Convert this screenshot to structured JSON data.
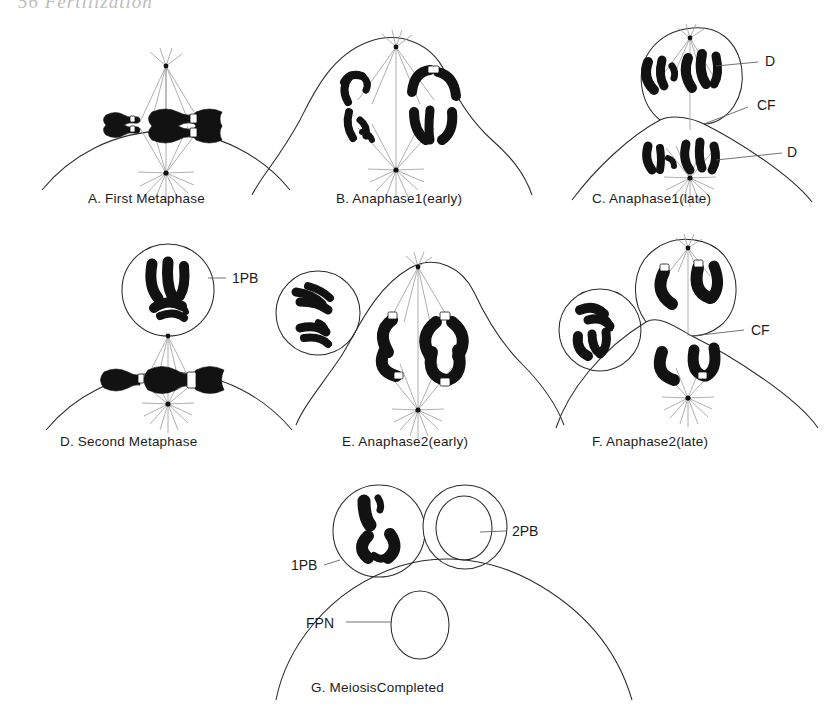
{
  "page": {
    "header_text": "56   Fertilization",
    "width": 831,
    "height": 712,
    "background": "#ffffff",
    "ink_color": "#1c1c1c",
    "chromosome_color": "#121212",
    "spindle_color": "#9a9a9a"
  },
  "figure": {
    "panels": [
      {
        "id": "A",
        "caption": "A. First Metaphase",
        "caption_x": 88,
        "caption_y": 203,
        "labels": []
      },
      {
        "id": "B",
        "caption": "B. Anaphase1(early)",
        "caption_x": 336,
        "caption_y": 203,
        "labels": []
      },
      {
        "id": "C",
        "caption": "C. Anaphase1(late)",
        "caption_x": 592,
        "caption_y": 203,
        "labels": [
          {
            "text": "D",
            "x": 765,
            "y": 66
          },
          {
            "text": "CF",
            "x": 757,
            "y": 110
          },
          {
            "text": "D",
            "x": 787,
            "y": 157
          }
        ]
      },
      {
        "id": "D",
        "caption": "D. Second Metaphase",
        "caption_x": 60,
        "caption_y": 446,
        "labels": [
          {
            "text": "1PB",
            "x": 232,
            "y": 281
          }
        ]
      },
      {
        "id": "E",
        "caption": "E. Anaphase2(early)",
        "caption_x": 342,
        "caption_y": 446,
        "labels": []
      },
      {
        "id": "F",
        "caption": "F. Anaphase2(late)",
        "caption_x": 592,
        "caption_y": 446,
        "labels": [
          {
            "text": "CF",
            "x": 751,
            "y": 332
          }
        ]
      },
      {
        "id": "G",
        "caption": "G. MeiosisCompleted",
        "caption_x": 311,
        "caption_y": 692,
        "labels": [
          {
            "text": "1PB",
            "x": 291,
            "y": 565
          },
          {
            "text": "2PB",
            "x": 486,
            "y": 536
          },
          {
            "text": "FPN",
            "x": 306,
            "y": 623
          }
        ]
      }
    ],
    "legend_abbreviations": [
      {
        "key": "D",
        "meaning": "Dyad"
      },
      {
        "key": "CF",
        "meaning": "Cleavage Furrow"
      },
      {
        "key": "1PB",
        "meaning": "First Polar Body"
      },
      {
        "key": "2PB",
        "meaning": "Second Polar Body"
      },
      {
        "key": "FPN",
        "meaning": "Female Pronucleus"
      }
    ]
  }
}
